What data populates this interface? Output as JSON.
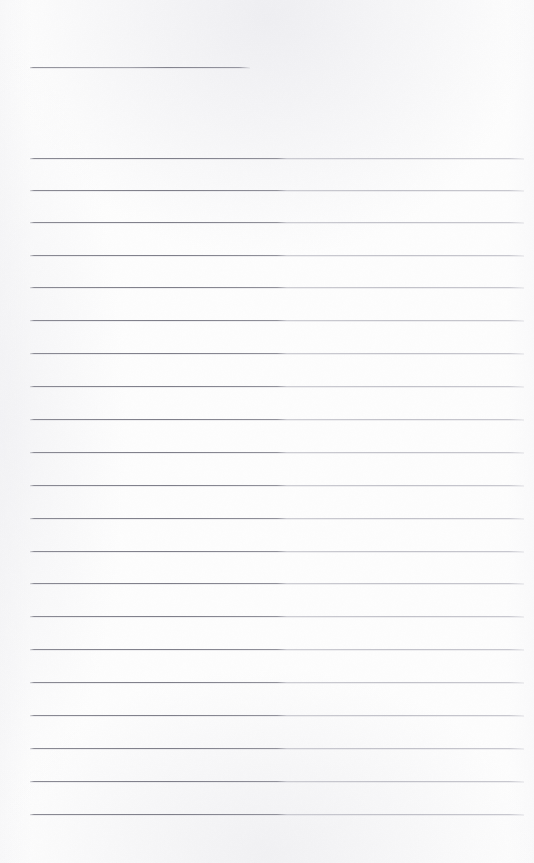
{
  "document": {
    "kind": "scanned-page",
    "description": "Blank ruled notebook page scan",
    "title": "",
    "visible_text": "",
    "page_width": 534,
    "page_height": 863
  },
  "colors": {
    "paper_background": "#fdfdfd",
    "rule_line_left": "#7e7e89",
    "rule_line_right": "#a8a8b3",
    "page_edge_shadow": "#ececf0"
  },
  "layout": {
    "rule_left_x": 30,
    "rule_right_x": 524,
    "rule_thickness": 1,
    "rule_spacing": 32.8,
    "top_margin_height": 67,
    "bottom_margin_height": 49
  },
  "rules": {
    "short_rule": {
      "label": "short-top-rule",
      "y": 67,
      "x_start": 30,
      "x_end": 250
    },
    "full_rules": [
      {
        "label": "rule-1",
        "y": 158
      },
      {
        "label": "rule-2",
        "y": 190
      },
      {
        "label": "rule-3",
        "y": 222
      },
      {
        "label": "rule-4",
        "y": 255
      },
      {
        "label": "rule-5",
        "y": 287
      },
      {
        "label": "rule-6",
        "y": 320
      },
      {
        "label": "rule-7",
        "y": 353
      },
      {
        "label": "rule-8",
        "y": 386
      },
      {
        "label": "rule-9",
        "y": 419
      },
      {
        "label": "rule-10",
        "y": 452
      },
      {
        "label": "rule-11",
        "y": 485
      },
      {
        "label": "rule-12",
        "y": 518
      },
      {
        "label": "rule-13",
        "y": 551
      },
      {
        "label": "rule-14",
        "y": 583
      },
      {
        "label": "rule-15",
        "y": 616
      },
      {
        "label": "rule-16",
        "y": 649
      },
      {
        "label": "rule-17",
        "y": 682
      },
      {
        "label": "rule-18",
        "y": 715
      },
      {
        "label": "rule-19",
        "y": 748
      },
      {
        "label": "rule-20",
        "y": 781
      },
      {
        "label": "rule-21",
        "y": 814
      }
    ]
  },
  "content": {
    "written_entries": [],
    "notes": "Page contains no handwriting, printed text, headings, numbers or marks other than the pre-printed horizontal ruling."
  }
}
